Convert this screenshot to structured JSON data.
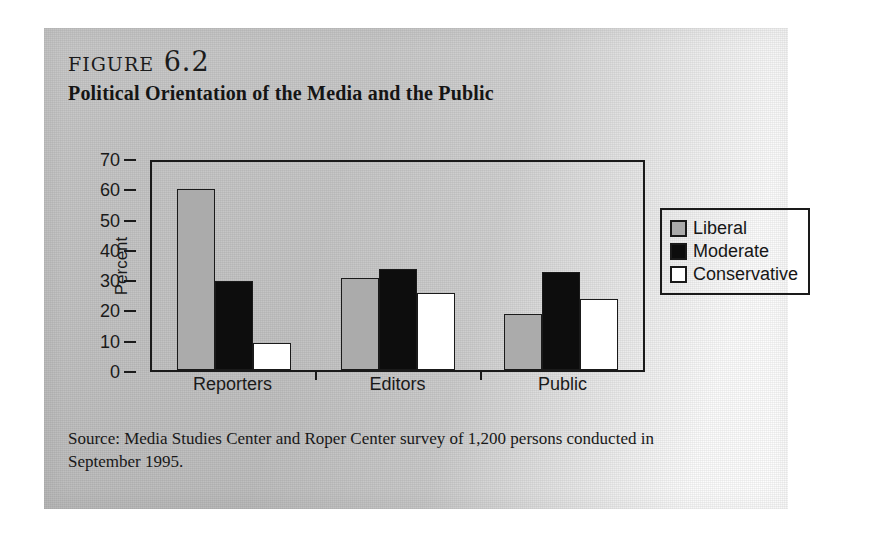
{
  "figure": {
    "label": "figure 6.2",
    "title": "Political Orientation of the Media and the Public",
    "source": "Source: Media Studies Center and Roper Center survey of 1,200 persons conducted in September 1995."
  },
  "colors": {
    "liberal": "#ababab",
    "moderate": "#0d0d0d",
    "conservative": "#ffffff",
    "axis": "#1a1a1a",
    "panel_background": "#c4c4c4"
  },
  "legend": {
    "position": "right",
    "items": [
      {
        "label": "Liberal",
        "swatch": "liberal"
      },
      {
        "label": "Moderate",
        "swatch": "moderate"
      },
      {
        "label": "Conservative",
        "swatch": "conservative"
      }
    ]
  },
  "axis": {
    "y_ticks": [
      "70",
      "60",
      "50",
      "40",
      "30",
      "20",
      "10",
      "0"
    ],
    "y_label": "Percent",
    "x_categories": [
      "Reporters",
      "Editors",
      "Public"
    ]
  },
  "chart_data": {
    "type": "bar",
    "title": "Political Orientation of the Media and the Public",
    "xlabel": "",
    "ylabel": "Percent",
    "ylim": [
      0,
      70
    ],
    "ytick_step": 10,
    "grid": false,
    "legend_position": "right",
    "categories": [
      "Reporters",
      "Editors",
      "Public"
    ],
    "series": [
      {
        "name": "Liberal",
        "values": [
          61,
          31,
          19
        ]
      },
      {
        "name": "Moderate",
        "values": [
          30,
          34,
          33
        ]
      },
      {
        "name": "Conservative",
        "values": [
          9,
          26,
          24
        ]
      }
    ]
  }
}
